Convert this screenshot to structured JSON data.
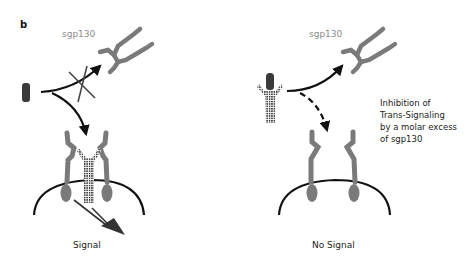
{
  "figure": {
    "panel_label": "b",
    "colors": {
      "receptor_grey": "#7a7a7a",
      "ligand_dark": "#3a3a3a",
      "line_black": "#111111",
      "text_grey": "#8a8a8a"
    },
    "left_panel": {
      "sgp130_label": "sgp130",
      "outcome_label": "Signal",
      "description": "IL-6 (dark rod) binds membrane receptor complex; pathway to sgp130 is crossed out"
    },
    "right_panel": {
      "sgp130_label": "sgp130",
      "outcome_label": "No Signal",
      "note_lines": [
        "Inhibition of",
        "Trans-Signaling",
        "by a molar excess",
        "of sgp130"
      ],
      "description": "IL-6/sIL-6R complex captured by sgp130; dashed arrow to membrane receptors"
    }
  }
}
